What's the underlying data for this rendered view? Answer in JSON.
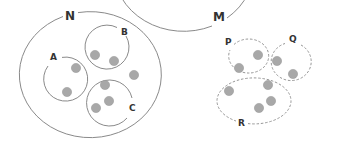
{
  "diagram": {
    "colors": {
      "stroke": "#8a8a8a",
      "dot_fill": "#a8a8a8",
      "dot_stroke": "#9a9a9a",
      "text": "#333333"
    },
    "sets": [
      {
        "name": "N",
        "label": "N",
        "outer": {
          "cx": 92,
          "cy": 74,
          "rx": 71,
          "ry": 63,
          "gap_label": [
            70,
            16
          ]
        },
        "subsets": [
          {
            "label": "A",
            "style": "solid-open",
            "cx": 66,
            "cy": 79,
            "r": 22,
            "label_pos": [
              55,
              60
            ],
            "dots": [
              [
                76,
                68
              ],
              [
                67,
                92
              ]
            ]
          },
          {
            "label": "B",
            "style": "solid-open",
            "cx": 107,
            "cy": 47,
            "r": 22,
            "label_pos": [
              125,
              34
            ],
            "dots": [
              [
                95,
                55
              ],
              [
                114,
                61
              ]
            ]
          },
          {
            "label": "C",
            "style": "solid-open",
            "cx": 110,
            "cy": 104,
            "r": 23,
            "label_pos": [
              132,
              110
            ],
            "dots": [
              [
                105,
                85
              ],
              [
                109,
                101
              ],
              [
                96,
                108
              ]
            ]
          }
        ],
        "loose_dots": [
          [
            134,
            75
          ]
        ]
      },
      {
        "name": "M",
        "label": "M",
        "outer": {
          "cx": 255,
          "cy": 75,
          "rx": 70,
          "ry": 62,
          "gap_label": [
            218,
            18
          ]
        },
        "subsets": [
          {
            "label": "P",
            "style": "dashed",
            "cx": 246,
            "cy": 58,
            "rx": 20,
            "ry": 17,
            "label_pos": [
              228,
              46
            ],
            "dots": [
              [
                258,
                55
              ],
              [
                239,
                68
              ]
            ]
          },
          {
            "label": "Q",
            "style": "dashed",
            "cx": 291,
            "cy": 62,
            "rx": 20,
            "ry": 19,
            "label_pos": [
              292,
              41
            ],
            "dots": [
              [
                277,
                61
              ],
              [
                293,
                74
              ]
            ]
          },
          {
            "label": "R",
            "style": "dashed",
            "cx": 255,
            "cy": 101,
            "rx": 37,
            "ry": 23,
            "label_pos": [
              241,
              124
            ],
            "dots": [
              [
                229,
                91
              ],
              [
                267,
                85
              ],
              [
                271,
                101
              ],
              [
                259,
                108
              ]
            ]
          }
        ],
        "loose_dots": []
      }
    ]
  }
}
